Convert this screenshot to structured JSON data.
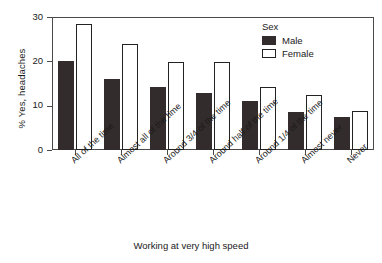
{
  "chart_data": {
    "type": "bar",
    "title": "",
    "xlabel": "Working at very high speed",
    "ylabel": "% Yes, headaches",
    "ylim": [
      0,
      30
    ],
    "yticks": [
      0,
      10,
      20,
      30
    ],
    "ytick_labels": [
      "0",
      "10",
      "20",
      "30"
    ],
    "grid": false,
    "legend_position": "top-right",
    "legend_title": "Sex",
    "categories": [
      "All of the time",
      "Almost all of the time",
      "Around 3/4 of the time",
      "Around half of the time",
      "Around 1/4 of the time",
      "Almost never",
      "Never"
    ],
    "series": [
      {
        "name": "Male",
        "color": "#332c2c",
        "values": [
          20.0,
          16.0,
          14.3,
          12.8,
          11.0,
          8.6,
          7.5
        ]
      },
      {
        "name": "Female",
        "color": "#ffffff",
        "values": [
          28.5,
          24.0,
          19.9,
          19.8,
          14.2,
          12.3,
          8.8
        ]
      }
    ]
  },
  "axes": {
    "y_title": "% Yes, headaches",
    "x_title": "Working at very high speed"
  },
  "legend": {
    "title": "Sex",
    "entries": [
      {
        "label": "Male"
      },
      {
        "label": "Female"
      }
    ]
  }
}
